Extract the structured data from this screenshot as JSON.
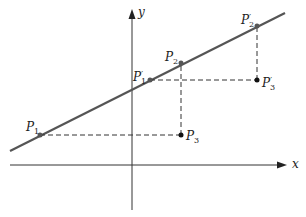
{
  "diagram": {
    "axes": {
      "x_label": "x",
      "y_label": "y"
    },
    "points": {
      "P1": {
        "base": "P",
        "sub": "1",
        "prime": ""
      },
      "P2": {
        "base": "P",
        "sub": "2",
        "prime": ""
      },
      "P3": {
        "base": "P",
        "sub": "3",
        "prime": ""
      },
      "P1p": {
        "base": "P",
        "sub": "1",
        "prime": "′"
      },
      "P2p": {
        "base": "P",
        "sub": "2",
        "prime": "′"
      },
      "P3p": {
        "base": "P",
        "sub": "3",
        "prime": "′"
      }
    },
    "colors": {
      "line": "#555555",
      "axis": "#333333",
      "dash": "#333333",
      "point": "#111111"
    }
  }
}
